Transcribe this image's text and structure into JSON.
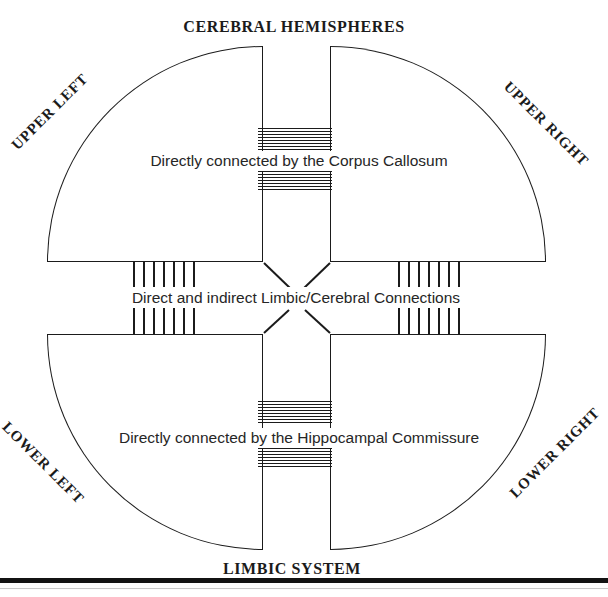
{
  "diagram": {
    "top_title": "CEREBRAL HEMISPHERES",
    "bottom_title": "LIMBIC SYSTEM",
    "quadrant_labels": {
      "upper_left": "UPPER LEFT",
      "upper_right": "UPPER RIGHT",
      "lower_left": "LOWER LEFT",
      "lower_right": "LOWER RIGHT"
    },
    "connection_labels": {
      "corpus_callosum": "Directly connected by the Corpus Callosum",
      "limbic_cerebral": "Direct and indirect Limbic/Cerebral Connections",
      "hippocampal_commissure": "Directly connected by the Hippocampal Commissure"
    },
    "colors": {
      "line": "#1b1b1b",
      "text": "#262626",
      "background": "#ffffff"
    }
  }
}
